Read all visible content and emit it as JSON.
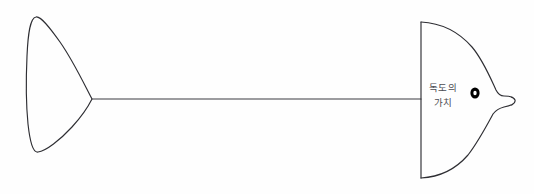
{
  "diagram": {
    "type": "fishbone",
    "title_lines": [
      "독도의",
      "가치"
    ],
    "background_color": "#fefefe",
    "stroke_color": "#2e2e33",
    "text_color": "#4b4b52",
    "eye_color": "#000000",
    "head": {
      "label_line_1": "독도의",
      "label_line_2": "가치",
      "eye_label": "fish-eye"
    },
    "tail": {
      "name": "tail-fin"
    },
    "spine": {
      "name": "spine-line"
    }
  }
}
